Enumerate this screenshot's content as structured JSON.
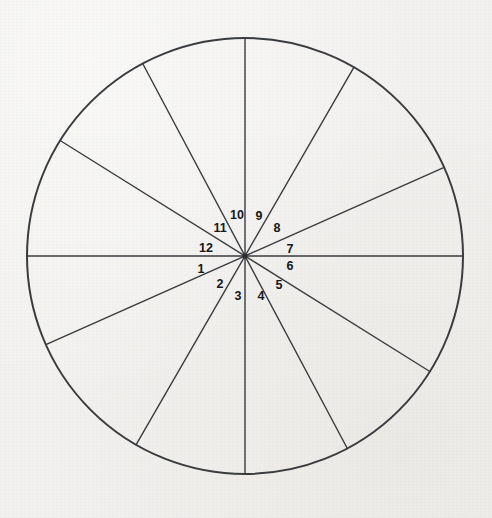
{
  "figure": {
    "background_color": "#f2f1ef",
    "line_color": "#3a3c40",
    "label_color": "#15171a"
  },
  "chart_data": {
    "type": "pie",
    "title": "",
    "subtitle": "",
    "xlabel": "",
    "ylabel": "",
    "legend": [],
    "grid": false,
    "center": {
      "x": 245,
      "y": 256
    },
    "radius": 218,
    "circle_stroke_width": 2.0,
    "spoke_stroke_width": 1.4,
    "label_radius": 42,
    "note": "Twelve sectors formed by six full diameters; labels 1-12 run counter-clockwise starting just below the left horizontal radius.",
    "boundary_angles_deg": [
      0,
      24,
      60,
      90,
      118,
      148,
      180,
      204,
      240,
      270,
      298,
      328
    ],
    "categories": [
      "1",
      "2",
      "3",
      "4",
      "5",
      "6",
      "7",
      "8",
      "9",
      "10",
      "11",
      "12"
    ],
    "values": [
      32,
      36,
      30,
      28,
      30,
      24,
      36,
      30,
      28,
      28,
      30,
      32
    ],
    "sectors": [
      {
        "label": "1",
        "start_deg": 180,
        "end_deg": 204,
        "label_x": 201,
        "label_y": 270,
        "span_deg": 24
      },
      {
        "label": "2",
        "start_deg": 204,
        "end_deg": 240,
        "label_x": 220,
        "label_y": 285,
        "span_deg": 36
      },
      {
        "label": "3",
        "start_deg": 240,
        "end_deg": 270,
        "label_x": 238,
        "label_y": 297,
        "span_deg": 30
      },
      {
        "label": "4",
        "start_deg": 270,
        "end_deg": 298,
        "label_x": 261,
        "label_y": 297,
        "span_deg": 28
      },
      {
        "label": "5",
        "start_deg": 298,
        "end_deg": 328,
        "label_x": 279,
        "label_y": 286,
        "span_deg": 30
      },
      {
        "label": "6",
        "start_deg": 328,
        "end_deg": 360,
        "label_x": 290,
        "label_y": 267,
        "span_deg": 32
      },
      {
        "label": "7",
        "start_deg": 0,
        "end_deg": 24,
        "label_x": 290,
        "label_y": 250,
        "span_deg": 24
      },
      {
        "label": "8",
        "start_deg": 24,
        "end_deg": 60,
        "label_x": 277,
        "label_y": 229,
        "span_deg": 36
      },
      {
        "label": "9",
        "start_deg": 60,
        "end_deg": 90,
        "label_x": 259,
        "label_y": 217,
        "span_deg": 30
      },
      {
        "label": "10",
        "start_deg": 90,
        "end_deg": 118,
        "label_x": 237,
        "label_y": 216,
        "span_deg": 28
      },
      {
        "label": "11",
        "start_deg": 118,
        "end_deg": 148,
        "label_x": 220,
        "label_y": 229,
        "span_deg": 30
      },
      {
        "label": "12",
        "start_deg": 148,
        "end_deg": 180,
        "label_x": 206,
        "label_y": 249,
        "span_deg": 32
      }
    ],
    "diameters": [
      {
        "name": "diameter-0-180",
        "angle_deg": 0
      },
      {
        "name": "diameter-24-204",
        "angle_deg": 24
      },
      {
        "name": "diameter-60-240",
        "angle_deg": 60
      },
      {
        "name": "diameter-90-270",
        "angle_deg": 90
      },
      {
        "name": "diameter-118-298",
        "angle_deg": 118
      },
      {
        "name": "diameter-148-328",
        "angle_deg": 148
      }
    ]
  }
}
